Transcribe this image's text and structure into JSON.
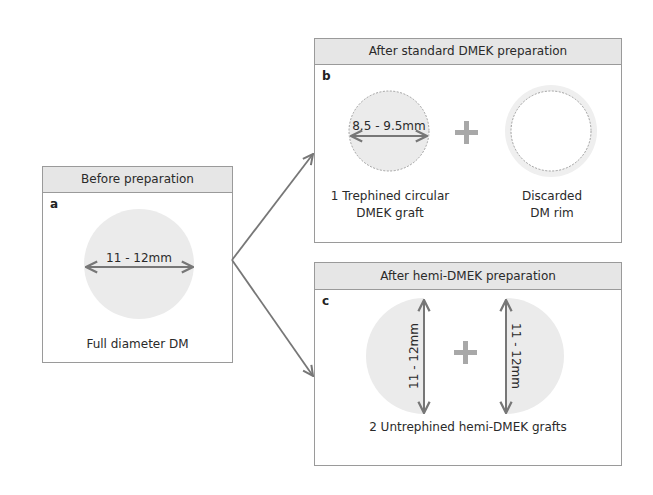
{
  "colors": {
    "disc_fill": "#ebebeb",
    "header_fill": "#e6e6e6",
    "border": "#9a9a9a",
    "arrow": "#777777",
    "plus": "#a8a8a8",
    "dashed_outline": "#8c8c8c"
  },
  "panels": {
    "a": {
      "header": "Before preparation",
      "letter": "a",
      "dimension": "11 - 12mm",
      "caption": "Full diameter DM"
    },
    "b": {
      "header": "After standard DMEK preparation",
      "letter": "b",
      "dimension": "8.5 - 9.5mm",
      "left_caption_line1": "1 Trephined circular",
      "left_caption_line2": "DMEK graft",
      "right_caption_line1": "Discarded",
      "right_caption_line2": "DM rim",
      "operator": "+"
    },
    "c": {
      "header": "After hemi-DMEK preparation",
      "letter": "c",
      "left_dimension": "11 - 12mm",
      "right_dimension": "11 - 12mm",
      "caption": "2 Untrephined hemi-DMEK grafts",
      "operator": "+"
    }
  }
}
